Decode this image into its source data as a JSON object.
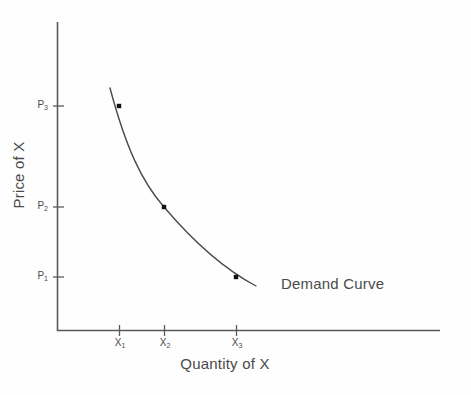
{
  "chart_data": {
    "type": "line",
    "title": "",
    "subtitle": "",
    "xlabel": "Quantity of X",
    "ylabel": "Price of X",
    "grid": false,
    "legend_position": "inline-annotation",
    "annotations": [
      {
        "text": "Demand Curve",
        "x_px": 281,
        "y_px": 275
      }
    ],
    "x_tick_labels": [
      "X",
      "X",
      "X"
    ],
    "x_tick_subscripts": [
      "1",
      "2",
      "3"
    ],
    "y_tick_labels": [
      "P",
      "P",
      "P"
    ],
    "y_tick_subscripts": [
      "1",
      "2",
      "3"
    ],
    "series": [
      {
        "name": "Demand Curve",
        "marked_points": [
          {
            "x_label": "X1",
            "y_label": "P3",
            "x_px": 119,
            "y_px": 106
          },
          {
            "x_label": "X2",
            "y_label": "P2",
            "x_px": 164,
            "y_px": 207
          },
          {
            "x_label": "X3",
            "y_label": "P1",
            "x_px": 236,
            "y_px": 277
          }
        ],
        "path_px": "M 110,88 C 126,148 142,182 164,207 C 192,240 222,268 256,286"
      }
    ],
    "axes_px": {
      "origin_x": 57,
      "origin_y": 331,
      "y_axis_top": 22,
      "x_axis_right": 440
    },
    "tick_positions_px": {
      "x": [
        119,
        164,
        236
      ],
      "y": [
        106,
        207,
        277
      ]
    },
    "colors": {
      "axis": "#5a5a5a",
      "curve": "#4a4a4a",
      "marker": "#111111",
      "text": "#4a4a4a",
      "background": "#fefefe"
    }
  },
  "labels": {
    "y_axis_title": "Price of X",
    "x_axis_title": "Quantity of X",
    "curve_annotation": "Demand Curve",
    "y_tick_1": "P",
    "y_tick_1_sub": "1",
    "y_tick_2": "P",
    "y_tick_2_sub": "2",
    "y_tick_3": "P",
    "y_tick_3_sub": "3",
    "x_tick_1": "X",
    "x_tick_1_sub": "1",
    "x_tick_2": "X",
    "x_tick_2_sub": "2",
    "x_tick_3": "X",
    "x_tick_3_sub": "3"
  }
}
